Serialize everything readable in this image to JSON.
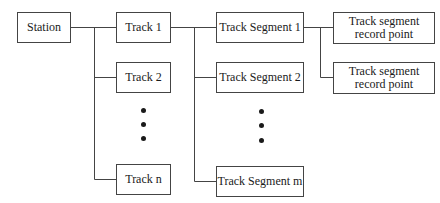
{
  "diagram": {
    "type": "hierarchy",
    "nodes": {
      "station": "Station",
      "tracks": [
        "Track 1",
        "Track 2",
        "Track n"
      ],
      "segments": [
        "Track Segment 1",
        "Track Segment 2",
        "Track Segment m"
      ],
      "record_points": [
        "Track segment record point",
        "Track segment record point"
      ]
    },
    "ellipsis": [
      "•",
      "•",
      "•"
    ],
    "edges": [
      [
        "Station",
        "Track 1"
      ],
      [
        "Station",
        "Track 2"
      ],
      [
        "Station",
        "Track n"
      ],
      [
        "Track 1",
        "Track Segment 1"
      ],
      [
        "Track 1",
        "Track Segment 2"
      ],
      [
        "Track 1",
        "Track Segment m"
      ],
      [
        "Track Segment 1",
        "Track segment record point"
      ],
      [
        "Track Segment 1",
        "Track segment record point"
      ]
    ],
    "colors": {
      "line": "#444444",
      "text": "#1a1a1a",
      "background": "#ffffff"
    }
  }
}
